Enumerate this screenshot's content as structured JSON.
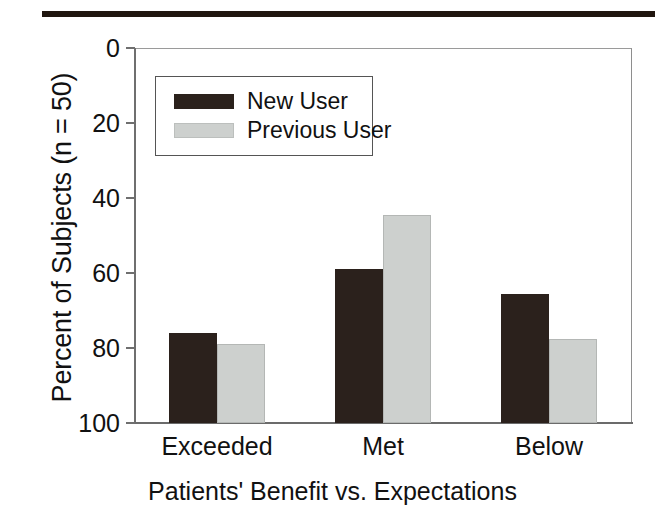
{
  "figure": {
    "top_rule": "horizontal-rule",
    "background_color": "#ffffff",
    "ink_color": "#111111"
  },
  "legend": {
    "position": "upper-left-inside",
    "entries": [
      {
        "label": "New User",
        "color": "#2b211c",
        "swatch": "dark-filled-rect"
      },
      {
        "label": "Previous User",
        "color": "#cdd0ce",
        "swatch": "light-gray-filled-rect"
      }
    ]
  },
  "axes": {
    "y_ticks": [
      "100",
      "80",
      "60",
      "40",
      "20",
      "0"
    ],
    "y_tick_values": [
      100,
      80,
      60,
      40,
      20,
      0
    ]
  },
  "chart_data": {
    "type": "bar",
    "title": "",
    "subtitle": "",
    "xlabel": "Patients' Benefit vs. Expectations",
    "ylabel": "Percent of Subjects (n = 50)",
    "categories": [
      "Exceeded",
      "Met",
      "Below"
    ],
    "series": [
      {
        "name": "New User",
        "color": "#2b211c",
        "values": [
          24,
          41,
          34.5
        ]
      },
      {
        "name": "Previous User",
        "color": "#cdd0ce",
        "values": [
          21,
          55.5,
          22.5
        ]
      }
    ],
    "ylim": [
      0,
      100
    ],
    "yticks": [
      0,
      20,
      40,
      60,
      80,
      100
    ],
    "grid": false,
    "legend_position": "upper left",
    "n": 50,
    "bar_group_layout": "grouped-adjacent",
    "annotations": []
  }
}
